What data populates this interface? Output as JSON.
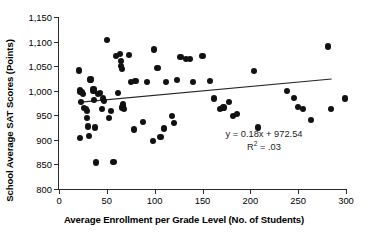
{
  "chart_data": {
    "type": "scatter",
    "title": "",
    "xlabel": "Average Enrollment per Grade Level (No. of Students)",
    "ylabel": "School Average SAT Scores (Points)",
    "xlim": [
      0,
      300
    ],
    "ylim": [
      800,
      1150
    ],
    "xticks": [
      0,
      50,
      100,
      150,
      200,
      250,
      300
    ],
    "xticklabels": [
      "0",
      "50",
      "100",
      "150",
      "200",
      "250",
      "300"
    ],
    "yticks": [
      800,
      850,
      900,
      950,
      1000,
      1050,
      1100,
      1150
    ],
    "yticklabels": [
      "800",
      "850",
      "900",
      "950",
      "1,000",
      "1,050",
      "1,100",
      "1,150"
    ],
    "grid": false,
    "legend": false,
    "marker_color": "#111111",
    "axis_color": "#2b2b2b",
    "annotations": {
      "equation": "y = 0.18x + 972.54",
      "r_squared_prefix": "R",
      "r_squared_exponent": "2",
      "r_squared_value": " = .03"
    },
    "trendline": {
      "slope": 0.18,
      "intercept": 972.54,
      "r_squared": 0.03,
      "x_start": 20,
      "x_end": 285,
      "color": "#262626"
    },
    "points": [
      [
        21,
        1041
      ],
      [
        22,
        1001
      ],
      [
        22,
        997
      ],
      [
        24,
        998
      ],
      [
        25,
        993
      ],
      [
        23,
        977
      ],
      [
        22,
        903
      ],
      [
        26,
        964
      ],
      [
        28,
        963
      ],
      [
        29,
        959
      ],
      [
        30,
        927
      ],
      [
        29,
        944
      ],
      [
        31,
        908
      ],
      [
        33,
        1023
      ],
      [
        36,
        1004
      ],
      [
        36,
        1000
      ],
      [
        37,
        981
      ],
      [
        38,
        925
      ],
      [
        39,
        854
      ],
      [
        41,
        993
      ],
      [
        43,
        995
      ],
      [
        45,
        962
      ],
      [
        46,
        984
      ],
      [
        47,
        979
      ],
      [
        50,
        1104
      ],
      [
        52,
        944
      ],
      [
        54,
        958
      ],
      [
        57,
        855
      ],
      [
        60,
        1070
      ],
      [
        62,
        995
      ],
      [
        64,
        1074
      ],
      [
        65,
        1061
      ],
      [
        65,
        1051
      ],
      [
        66,
        1044
      ],
      [
        67,
        972
      ],
      [
        67,
        968
      ],
      [
        66,
        966
      ],
      [
        68,
        963
      ],
      [
        73,
        1073
      ],
      [
        75,
        1018
      ],
      [
        78,
        921
      ],
      [
        80,
        1019
      ],
      [
        88,
        937
      ],
      [
        92,
        1017
      ],
      [
        98,
        898
      ],
      [
        99,
        1084
      ],
      [
        103,
        1047
      ],
      [
        106,
        905
      ],
      [
        110,
        923
      ],
      [
        112,
        1018
      ],
      [
        118,
        948
      ],
      [
        120,
        935
      ],
      [
        123,
        1022
      ],
      [
        127,
        1068
      ],
      [
        133,
        1065
      ],
      [
        137,
        1064
      ],
      [
        140,
        1017
      ],
      [
        150,
        1070
      ],
      [
        158,
        1020
      ],
      [
        162,
        984
      ],
      [
        168,
        963
      ],
      [
        172,
        966
      ],
      [
        178,
        977
      ],
      [
        182,
        948
      ],
      [
        186,
        953
      ],
      [
        204,
        1040
      ],
      [
        208,
        925
      ],
      [
        238,
        1000
      ],
      [
        246,
        986
      ],
      [
        250,
        967
      ],
      [
        255,
        962
      ],
      [
        263,
        941
      ],
      [
        281,
        1090
      ],
      [
        284,
        962
      ],
      [
        299,
        984
      ]
    ]
  }
}
